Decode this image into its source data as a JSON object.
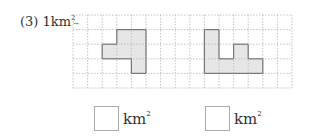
{
  "problem": {
    "number": "(3)",
    "scale_value": "1",
    "scale_unit": "km",
    "scale_exp": "2"
  },
  "grid": {
    "cols": 15,
    "rows": 5,
    "cell": 14.6,
    "origin_x": 73,
    "origin_y": 15,
    "line_color": "#aaaaaa",
    "fill_color": "#e6e6e6",
    "outline_color": "#777777"
  },
  "shapes": [
    {
      "name": "left-shape",
      "cells": [
        [
          3,
          1
        ],
        [
          4,
          1
        ],
        [
          2,
          2
        ],
        [
          3,
          2
        ],
        [
          4,
          2
        ],
        [
          4,
          3
        ]
      ]
    },
    {
      "name": "right-shape",
      "cells": [
        [
          9,
          1
        ],
        [
          9,
          2
        ],
        [
          9,
          3
        ],
        [
          10,
          3
        ],
        [
          11,
          2
        ],
        [
          11,
          3
        ],
        [
          12,
          3
        ]
      ]
    }
  ],
  "answers": [
    {
      "value": "",
      "unit": "km",
      "exp": "2"
    },
    {
      "value": "",
      "unit": "km",
      "exp": "2"
    }
  ]
}
